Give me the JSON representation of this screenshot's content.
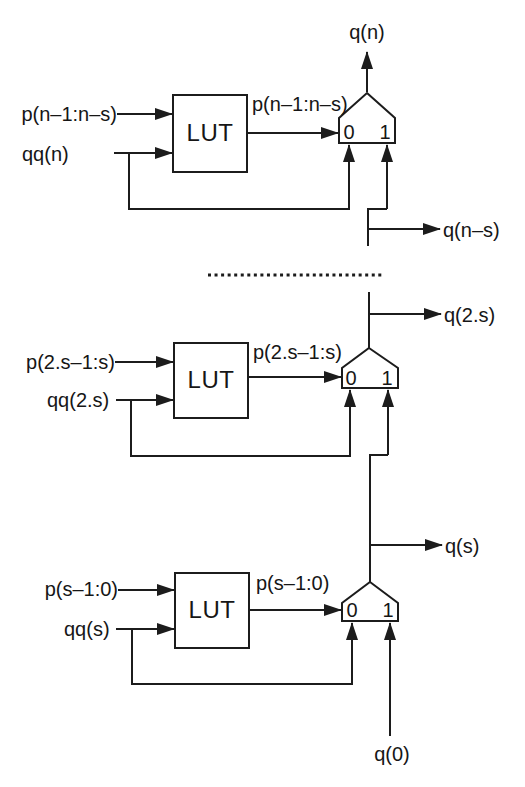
{
  "colors": {
    "ink": "#1c1c1c",
    "paper": "#ffffff"
  },
  "stages": [
    {
      "p_in": "p(n–1:n–s)",
      "qq_in": "qq(n)",
      "lut": "LUT",
      "p_out": "p(n–1:n–s)",
      "mux0": "0",
      "mux1": "1",
      "q_top": "q(n)",
      "q_tap": "q(n–s)"
    },
    {
      "p_in": "p(2.s–1:s)",
      "qq_in": "qq(2.s)",
      "lut": "LUT",
      "p_out": "p(2.s–1:s)",
      "mux0": "0",
      "mux1": "1",
      "q_tap": "q(2.s)"
    },
    {
      "p_in": "p(s–1:0)",
      "qq_in": "qq(s)",
      "lut": "LUT",
      "p_out": "p(s–1:0)",
      "mux0": "0",
      "mux1": "1",
      "q_tap": "q(s)",
      "q0_in": "q(0)"
    }
  ]
}
